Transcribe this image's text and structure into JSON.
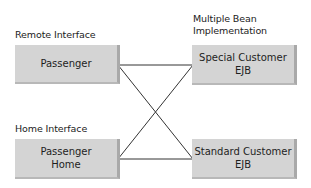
{
  "diagram": {
    "labels": {
      "remote_interface": "Remote Interface",
      "multiple_bean_line1": "Multiple Bean",
      "multiple_bean_line2": "Implementation",
      "home_interface": "Home Interface"
    },
    "boxes": {
      "passenger": {
        "line1": "Passenger"
      },
      "special_customer": {
        "line1": "Special Customer",
        "line2": "EJB"
      },
      "passenger_home": {
        "line1": "Passenger",
        "line2": "Home"
      },
      "standard_customer": {
        "line1": "Standard Customer",
        "line2": "EJB"
      }
    },
    "connections": [
      {
        "from": "Passenger",
        "to": "Special Customer EJB"
      },
      {
        "from": "Passenger",
        "to": "Standard Customer EJB"
      },
      {
        "from": "Passenger Home",
        "to": "Special Customer EJB"
      },
      {
        "from": "Passenger Home",
        "to": "Standard Customer EJB"
      }
    ],
    "colors": {
      "box_fill": "#d4d4d4",
      "box_shadow": "#a9a9a9",
      "line": "#333333"
    }
  }
}
